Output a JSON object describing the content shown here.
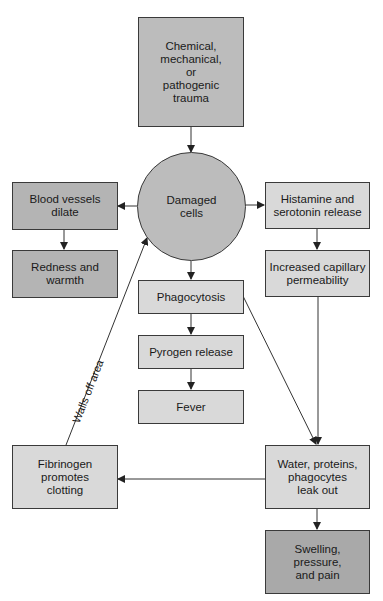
{
  "diagram": {
    "nodes": {
      "trauma": {
        "label": "Chemical,\nmechanical,\nor\npathogenic\ntrauma"
      },
      "damaged_cells": {
        "label": "Damaged\ncells"
      },
      "blood_vessels": {
        "label": "Blood vessels\ndilate"
      },
      "redness": {
        "label": "Redness and\nwarmth"
      },
      "histamine": {
        "label": "Histamine and\nserotonin release"
      },
      "permeability": {
        "label": "Increased capillary\npermeability"
      },
      "phagocytosis": {
        "label": "Phagocytosis"
      },
      "pyrogen": {
        "label": "Pyrogen release"
      },
      "fever": {
        "label": "Fever"
      },
      "fibrinogen": {
        "label": "Fibrinogen\npromotes\nclotting"
      },
      "leak_out": {
        "label": "Water, proteins,\nphagocytes\nleak out"
      },
      "swelling": {
        "label": "Swelling,\npressure,\nand pain"
      }
    },
    "edges": [
      {
        "from": "trauma",
        "to": "damaged_cells"
      },
      {
        "from": "damaged_cells",
        "to": "blood_vessels"
      },
      {
        "from": "blood_vessels",
        "to": "redness"
      },
      {
        "from": "damaged_cells",
        "to": "histamine"
      },
      {
        "from": "histamine",
        "to": "permeability"
      },
      {
        "from": "damaged_cells",
        "to": "phagocytosis"
      },
      {
        "from": "phagocytosis",
        "to": "pyrogen"
      },
      {
        "from": "pyrogen",
        "to": "fever"
      },
      {
        "from": "phagocytosis",
        "to": "leak_out"
      },
      {
        "from": "permeability",
        "to": "leak_out"
      },
      {
        "from": "leak_out",
        "to": "fibrinogen"
      },
      {
        "from": "leak_out",
        "to": "swelling"
      },
      {
        "from": "fibrinogen",
        "to": "damaged_cells",
        "label": "Walls off area"
      }
    ],
    "edge_labels": {
      "walls_off": "Walls off area"
    }
  }
}
